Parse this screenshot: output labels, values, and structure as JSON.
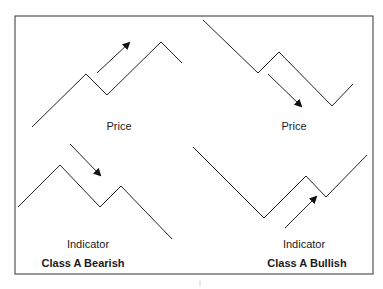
{
  "figure": {
    "frame": {
      "x": 15,
      "y": 16,
      "width": 358,
      "height": 258,
      "stroke": "#333333"
    },
    "line_color": "#222222",
    "panels": [
      {
        "name": "class-a-bearish",
        "title": "Class A Bearish",
        "price": {
          "label": "Price",
          "points": [
            [
              32,
              127
            ],
            [
              86,
              74
            ],
            [
              107,
              95
            ],
            [
              161,
              42
            ],
            [
              182,
              63
            ]
          ],
          "arrow": {
            "from": [
              97,
              73
            ],
            "to": [
              129,
              43
            ],
            "direction": "up"
          }
        },
        "indicator": {
          "label": "Indicator",
          "points": [
            [
              18,
              207
            ],
            [
              60,
              165
            ],
            [
              100,
              207
            ],
            [
              121,
              186
            ],
            [
              172,
              239
            ]
          ],
          "arrow": {
            "from": [
              70,
              144
            ],
            "to": [
              100,
              175
            ],
            "direction": "down"
          }
        }
      },
      {
        "name": "class-a-bullish",
        "title": "Class A Bullish",
        "price": {
          "label": "Price",
          "points": [
            [
              203,
              20
            ],
            [
              258,
              73
            ],
            [
              279,
              52
            ],
            [
              332,
              106
            ],
            [
              353,
              84
            ]
          ],
          "arrow": {
            "from": [
              268,
              74
            ],
            "to": [
              301,
              106
            ],
            "direction": "down"
          }
        },
        "indicator": {
          "label": "Indicator",
          "points": [
            [
              193,
              147
            ],
            [
              264,
              218
            ],
            [
              306,
              176
            ],
            [
              326,
              197
            ],
            [
              367,
              155
            ]
          ],
          "arrow": {
            "from": [
              285,
              228
            ],
            "to": [
              316,
              197
            ],
            "direction": "up"
          }
        }
      }
    ]
  }
}
